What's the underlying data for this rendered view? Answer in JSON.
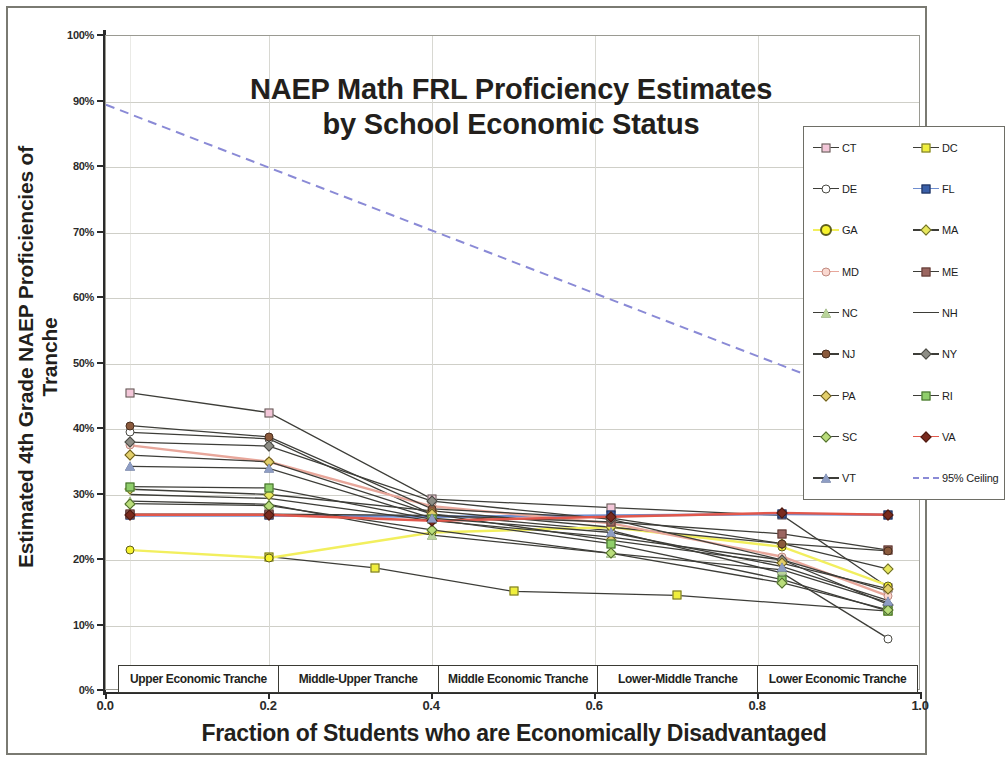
{
  "chart_data": {
    "type": "line",
    "title": "NAEP Math FRL Proficiency Estimates by School Economic Status",
    "title_line1": "NAEP Math FRL Proficiency Estimates",
    "title_line2": "by School Economic Status",
    "xlabel": "Fraction of Students who are Economically Disadvantaged",
    "ylabel": "Estimated 4th Grade NAEP Proficiencies of Tranche",
    "ylabel_line1": "Estimated 4th Grade NAEP Proficiencies of",
    "ylabel_line2": "Tranche",
    "xlim": [
      0.0,
      1.0
    ],
    "ylim": [
      0,
      100
    ],
    "y_unit": "%",
    "grid": true,
    "legend_position": "upper-right inside plot",
    "x_tick_labels": [
      "0.0",
      "0.2",
      "0.4",
      "0.6",
      "0.8",
      "1.0"
    ],
    "x_ticks": [
      0.0,
      0.2,
      0.4,
      0.6,
      0.8,
      1.0
    ],
    "y_tick_labels": [
      "0%",
      "10%",
      "20%",
      "30%",
      "40%",
      "50%",
      "60%",
      "70%",
      "80%",
      "90%",
      "100%"
    ],
    "y_ticks": [
      0,
      10,
      20,
      30,
      40,
      50,
      60,
      70,
      80,
      90,
      100
    ],
    "tranche_bands": [
      "Upper Economic Tranche",
      "Middle-Upper Tranche",
      "Middle Economic Tranche",
      "Lower-Middle Tranche",
      "Lower Economic Tranche"
    ],
    "series": [
      {
        "name": "CT",
        "marker": "square",
        "fill": "#f3c6d8",
        "stroke": "#5a5a52",
        "line": "#3d3d38",
        "x": [
          0.03,
          0.2,
          0.4,
          0.62,
          0.83,
          0.96
        ],
        "values": [
          45.5,
          42.5,
          29.3,
          28.0,
          26.8,
          15.8
        ]
      },
      {
        "name": "DC",
        "marker": "square",
        "fill": "#f0ef3c",
        "stroke": "#6b6b30",
        "line": "#3d3d38",
        "x": [
          0.2,
          0.33,
          0.5,
          0.7,
          0.96
        ],
        "values": [
          20.5,
          18.8,
          15.2,
          14.6,
          12.2
        ]
      },
      {
        "name": "DE",
        "marker": "circle",
        "fill": "#ffffff",
        "stroke": "#4a4a44",
        "line": "#3d3d38",
        "x": [
          0.03,
          0.2,
          0.4,
          0.62,
          0.83,
          0.96
        ],
        "values": [
          39.5,
          38.5,
          27.0,
          24.5,
          18.0,
          8.0
        ]
      },
      {
        "name": "FL",
        "marker": "square",
        "fill": "#3a5fa8",
        "stroke": "#1f2f55",
        "line": "#6f8ed0",
        "x": [
          0.03,
          0.2,
          0.4,
          0.62,
          0.83,
          0.96
        ],
        "values": [
          26.8,
          26.8,
          26.6,
          26.8,
          27.0,
          26.9
        ]
      },
      {
        "name": "GA",
        "marker": "circle",
        "fill": "#f7f32e",
        "stroke": "#5e5e1c",
        "line": "#f2ef5e",
        "x": [
          0.03,
          0.2,
          0.4,
          0.62,
          0.83,
          0.96
        ],
        "values": [
          21.5,
          20.3,
          24.2,
          25.0,
          22.0,
          16.1
        ]
      },
      {
        "name": "MA",
        "marker": "diamond",
        "fill": "#e8e85c",
        "stroke": "#6a6a2c",
        "line": "#3d3d38",
        "x": [
          0.03,
          0.2,
          0.4,
          0.62,
          0.83,
          0.96
        ],
        "values": [
          30.8,
          30.0,
          27.5,
          25.0,
          22.5,
          18.6
        ]
      },
      {
        "name": "MD",
        "marker": "circle",
        "fill": "#fad8d0",
        "stroke": "#c08a80",
        "line": "#e8a79b",
        "x": [
          0.03,
          0.2,
          0.4,
          0.62,
          0.83,
          0.96
        ],
        "values": [
          37.5,
          35.0,
          28.2,
          25.6,
          20.5,
          14.5
        ]
      },
      {
        "name": "ME",
        "marker": "square",
        "fill": "#9b6660",
        "stroke": "#5c3a35",
        "line": "#3d3d38",
        "x": [
          0.03,
          0.2,
          0.4,
          0.62,
          0.83,
          0.96
        ],
        "values": [
          27.0,
          27.0,
          26.8,
          25.8,
          24.0,
          21.5
        ]
      },
      {
        "name": "NC",
        "marker": "triangle",
        "fill": "#b9d49a",
        "stroke": "#4e6a38",
        "line": "#3d3d38",
        "x": [
          0.03,
          0.2,
          0.4,
          0.62,
          0.83,
          0.96
        ],
        "values": [
          29.0,
          28.5,
          23.8,
          21.0,
          18.5,
          13.5
        ]
      },
      {
        "name": "NH",
        "marker": "none",
        "fill": "#3d3d38",
        "stroke": "#3d3d38",
        "line": "#3d3d38",
        "x": [
          0.03,
          0.2,
          0.4,
          0.62,
          0.83,
          0.96
        ],
        "values": [
          30.0,
          29.4,
          26.0,
          23.5,
          20.0,
          15.2
        ]
      },
      {
        "name": "NJ",
        "marker": "circle",
        "fill": "#8b5a3c",
        "stroke": "#4a2f20",
        "line": "#3d3d38",
        "x": [
          0.03,
          0.2,
          0.4,
          0.62,
          0.83,
          0.96
        ],
        "values": [
          40.5,
          38.8,
          27.8,
          26.4,
          22.5,
          21.4
        ]
      },
      {
        "name": "NY",
        "marker": "diamond",
        "fill": "#8d8d85",
        "stroke": "#4a4a44",
        "line": "#3d3d38",
        "x": [
          0.03,
          0.2,
          0.4,
          0.62,
          0.83,
          0.96
        ],
        "values": [
          38.0,
          37.4,
          29.0,
          26.2,
          20.0,
          13.2
        ]
      },
      {
        "name": "PA",
        "marker": "diamond",
        "fill": "#e3cf6a",
        "stroke": "#6a5c1f",
        "line": "#3d3d38",
        "x": [
          0.03,
          0.2,
          0.4,
          0.62,
          0.83,
          0.96
        ],
        "values": [
          36.0,
          35.0,
          27.0,
          23.0,
          19.5,
          15.6
        ]
      },
      {
        "name": "RI",
        "marker": "square",
        "fill": "#8fce6a",
        "stroke": "#41662a",
        "line": "#3d3d38",
        "x": [
          0.03,
          0.2,
          0.4,
          0.62,
          0.83,
          0.96
        ],
        "values": [
          31.2,
          31.0,
          26.2,
          22.5,
          17.0,
          12.2
        ]
      },
      {
        "name": "SC",
        "marker": "diamond",
        "fill": "#b9dd7a",
        "stroke": "#4e6a2e",
        "line": "#3d3d38",
        "x": [
          0.03,
          0.2,
          0.4,
          0.62,
          0.83,
          0.96
        ],
        "values": [
          28.6,
          28.3,
          24.6,
          21.0,
          16.5,
          12.4
        ]
      },
      {
        "name": "VA",
        "marker": "diamond",
        "fill": "#7a2a1e",
        "stroke": "#4a1a12",
        "line": "#e2584c",
        "x": [
          0.03,
          0.2,
          0.4,
          0.62,
          0.83,
          0.96
        ],
        "values": [
          26.9,
          26.9,
          26.0,
          26.6,
          27.2,
          26.9
        ]
      },
      {
        "name": "VT",
        "marker": "triangle",
        "fill": "#8e9dc4",
        "stroke": "#3d4a6d",
        "line": "#3d3d38",
        "x": [
          0.03,
          0.2,
          0.4,
          0.62,
          0.83,
          0.96
        ],
        "values": [
          34.3,
          34.0,
          26.4,
          24.2,
          19.0,
          13.8
        ]
      },
      {
        "name": "95% Ceiling",
        "marker": "none",
        "fill": "#8a8ad6",
        "stroke": "#8a8ad6",
        "line": "#8a8ad6",
        "dashed": true,
        "x": [
          0.0,
          1.0
        ],
        "values": [
          89.5,
          41.5
        ]
      }
    ],
    "legend": [
      {
        "label": "CT",
        "marker": "square",
        "fill": "#f3c6d8",
        "stroke": "#5a5a52",
        "line": "#3d3d38"
      },
      {
        "label": "DC",
        "marker": "square",
        "fill": "#f0ef3c",
        "stroke": "#6b6b30",
        "line": "#3d3d38"
      },
      {
        "label": "DE",
        "marker": "circle",
        "fill": "#ffffff",
        "stroke": "#4a4a44",
        "line": "#3d3d38"
      },
      {
        "label": "FL",
        "marker": "square",
        "fill": "#3a5fa8",
        "stroke": "#1f2f55",
        "line": "#6f8ed0"
      },
      {
        "label": "GA",
        "marker": "circle-lg",
        "fill": "#f7f32e",
        "stroke": "#5e5e1c",
        "line": "#f2ef5e"
      },
      {
        "label": "MA",
        "marker": "diamond",
        "fill": "#e8e85c",
        "stroke": "#6a6a2c",
        "line": "#3d3d38"
      },
      {
        "label": "MD",
        "marker": "circle",
        "fill": "#fad8d0",
        "stroke": "#c08a80",
        "line": "#e8a79b"
      },
      {
        "label": "ME",
        "marker": "square",
        "fill": "#9b6660",
        "stroke": "#5c3a35",
        "line": "#3d3d38"
      },
      {
        "label": "NC",
        "marker": "triangle",
        "fill": "#b9d49a",
        "stroke": "#4e6a38",
        "line": "#3d3d38"
      },
      {
        "label": "NH",
        "marker": "none",
        "fill": "#3d3d38",
        "stroke": "#3d3d38",
        "line": "#3d3d38"
      },
      {
        "label": "NJ",
        "marker": "circle",
        "fill": "#8b5a3c",
        "stroke": "#4a2f20",
        "line": "#3d3d38"
      },
      {
        "label": "NY",
        "marker": "diamond",
        "fill": "#8d8d85",
        "stroke": "#4a4a44",
        "line": "#3d3d38"
      },
      {
        "label": "PA",
        "marker": "diamond",
        "fill": "#e3cf6a",
        "stroke": "#6a5c1f",
        "line": "#3d3d38"
      },
      {
        "label": "RI",
        "marker": "square",
        "fill": "#8fce6a",
        "stroke": "#41662a",
        "line": "#3d3d38"
      },
      {
        "label": "SC",
        "marker": "diamond",
        "fill": "#b9dd7a",
        "stroke": "#4e6a2e",
        "line": "#3d3d38"
      },
      {
        "label": "VA",
        "marker": "diamond",
        "fill": "#7a2a1e",
        "stroke": "#4a1a12",
        "line": "#e2584c"
      },
      {
        "label": "VT",
        "marker": "triangle",
        "fill": "#8e9dc4",
        "stroke": "#3d4a6d",
        "line": "#3d3d38"
      },
      {
        "label": "95% Ceiling",
        "marker": "none",
        "fill": "#8a8ad6",
        "stroke": "#8a8ad6",
        "line": "#8a8ad6",
        "dashed": true
      }
    ]
  }
}
